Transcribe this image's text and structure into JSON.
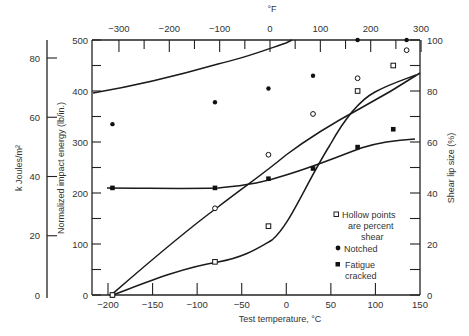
{
  "chart_data": {
    "type": "line",
    "title": "",
    "xlabel": "Test temperature, °C",
    "x2label": "°F",
    "ylabel": "Normalized impact energy (lb/in.)",
    "ylabel_alt": "k Joules/m²",
    "y2label": "Shear lip size (%)",
    "xlim": [
      -200,
      150
    ],
    "ylim": [
      0,
      500
    ],
    "y2lim": [
      0,
      100
    ],
    "x_ticks": [
      "-200",
      "-150",
      "-100",
      "-50",
      "0",
      "50",
      "100",
      "150"
    ],
    "x2_ticks": [
      "-300",
      "-200",
      "-100",
      "0",
      "100",
      "200",
      "300"
    ],
    "y_ticks": [
      "0",
      "100",
      "200",
      "300",
      "400",
      "500"
    ],
    "y_alt_ticks": [
      "0",
      "20",
      "40",
      "60",
      "80"
    ],
    "y2_ticks": [
      "0",
      "20",
      "40",
      "60",
      "80",
      "100"
    ],
    "grid": false,
    "series": [
      {
        "name": "Notched impact energy",
        "marker": "filled-circle",
        "axis": "left",
        "x": [
          -195,
          -80,
          -20,
          80,
          135
        ],
        "y": [
          335,
          378,
          405,
          500,
          500
        ]
      },
      {
        "name": "Notched impact energy (outlier)",
        "marker": "filled-circle",
        "axis": "left",
        "x": [
          30
        ],
        "y": [
          430
        ]
      },
      {
        "name": "Fatigue cracked impact energy",
        "marker": "filled-square",
        "axis": "left",
        "x": [
          -195,
          -80,
          -20,
          30,
          80,
          120
        ],
        "y": [
          210,
          210,
          228,
          248,
          290,
          325
        ]
      },
      {
        "name": "Notched shear lip",
        "marker": "hollow-circle",
        "axis": "right",
        "x": [
          -195,
          -80,
          -20,
          30,
          80,
          135
        ],
        "y": [
          0,
          34,
          55,
          71,
          85,
          96
        ]
      },
      {
        "name": "Fatigue cracked shear lip",
        "marker": "hollow-square",
        "axis": "right",
        "x": [
          -195,
          -80,
          -20,
          80,
          120
        ],
        "y": [
          0,
          13,
          27,
          80,
          90
        ]
      }
    ],
    "legend": {
      "position": "lower right inside",
      "entries": [
        {
          "symbol": "hollow-square",
          "text": [
            "Hollow points",
            "are percent",
            "shear"
          ]
        },
        {
          "symbol": "filled-circle",
          "text": [
            "Notched"
          ]
        },
        {
          "symbol": "filled-square",
          "text": [
            "Fatigue",
            "cracked"
          ]
        }
      ]
    }
  }
}
